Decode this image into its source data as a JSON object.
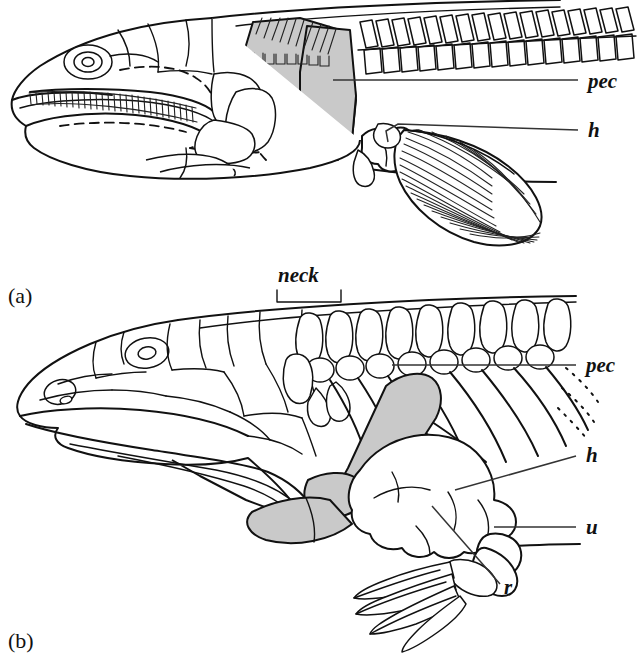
{
  "figure": {
    "background_color": "#ffffff",
    "ink_color": "#111111",
    "shade_color": "#c9c9c9"
  },
  "panels": [
    {
      "id": "a",
      "label": "(a)",
      "subject": "lobe-finned fish",
      "description": "Lateral view of fish head, skull roof, opercular series, shoulder girdle and pectoral fin",
      "labels": [
        {
          "key": "pec",
          "text": "pec",
          "meaning": "pectoral girdle / cleithrum"
        },
        {
          "key": "h",
          "text": "h",
          "meaning": "humerus"
        }
      ]
    },
    {
      "id": "b",
      "label": "(b)",
      "subject": "early tetrapod",
      "description": "Lateral view of tetrapod skull, cervical vertebrae, ribs, shoulder girdle and forelimb",
      "labels": [
        {
          "key": "neck",
          "text": "neck",
          "meaning": "cervical region"
        },
        {
          "key": "pec",
          "text": "pec",
          "meaning": "pectoral girdle"
        },
        {
          "key": "h",
          "text": "h",
          "meaning": "humerus"
        },
        {
          "key": "u",
          "text": "u",
          "meaning": "ulna"
        },
        {
          "key": "r",
          "text": "r",
          "meaning": "radius"
        }
      ]
    }
  ],
  "annotations": {
    "panel_a_label": "(a)",
    "panel_b_label": "(b)",
    "a_pec": "pec",
    "a_h": "h",
    "b_neck": "neck",
    "b_pec": "pec",
    "b_h": "h",
    "b_u": "u",
    "b_r": "r"
  }
}
